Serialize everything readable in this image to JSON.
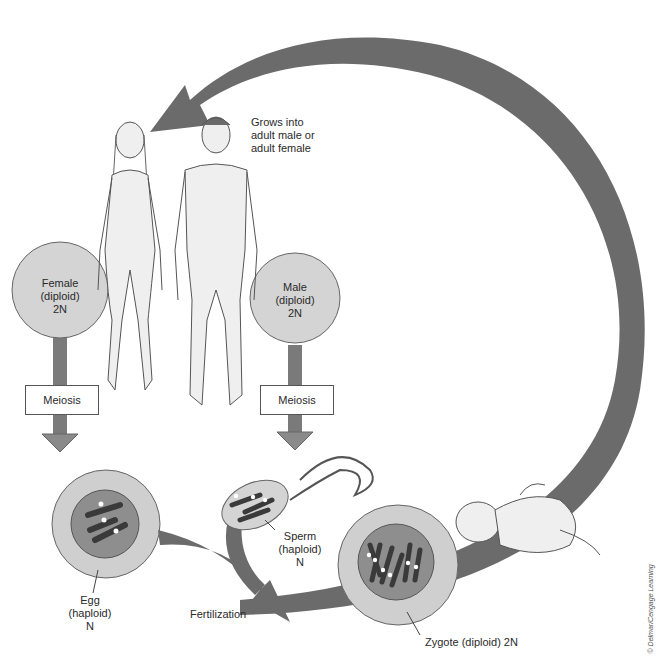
{
  "labels": {
    "grows": [
      "Grows into",
      "adult male or",
      "adult female"
    ],
    "female": [
      "Female",
      "(diploid)",
      "2N"
    ],
    "male": [
      "Male",
      "(diploid)",
      "2N"
    ],
    "meiosis_left": "Meiosis",
    "meiosis_right": "Meiosis",
    "egg": [
      "Egg",
      "(haploid)",
      "N"
    ],
    "sperm": [
      "Sperm",
      "(haploid)",
      "N"
    ],
    "fertilization": "Fertilization",
    "zygote": "Zygote (diploid) 2N",
    "credit": "© Delmar/Cengage Learning"
  },
  "colors": {
    "arrow": "#6b6b6b",
    "arrow_dark": "#555555",
    "cell_outer": "#cfcfcf",
    "cell_nucleus": "#8e8e8e",
    "chromosome": "#3a3a3a",
    "circle_fill": "#d4d4d4",
    "figure_fill": "#efefef",
    "figure_stroke": "#555555"
  }
}
